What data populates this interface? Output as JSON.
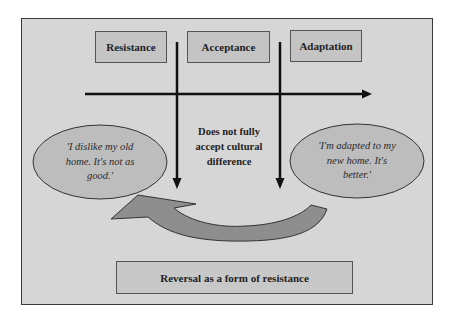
{
  "diagram": {
    "stages": [
      {
        "label": "Resistance"
      },
      {
        "label": "Acceptance"
      },
      {
        "label": "Adaptation"
      }
    ],
    "center_note": {
      "lines": [
        "Does not fully",
        "accept cultural",
        "difference"
      ]
    },
    "left_quote": {
      "lines": [
        "'I dislike my old",
        "home. It's not as",
        "good.'"
      ]
    },
    "right_quote": {
      "lines": [
        "'I'm adapted to my",
        "new home. It's",
        "better.'"
      ]
    },
    "bottom_label": "Reversal as a form of resistance",
    "colors": {
      "background": "#d6d6d6",
      "box_fill": "#c4c4c4",
      "ellipse_fill": "#bdbdbd",
      "reversal_arrow_fill": "#8e8e8e",
      "line": "#111111"
    }
  }
}
